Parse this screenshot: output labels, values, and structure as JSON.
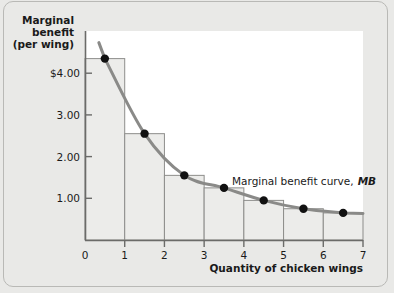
{
  "figure": {
    "background_color": "#e9e9e7",
    "frame_color": "#b9b9b6",
    "plot_background_color": "#ffffff"
  },
  "chart_data": {
    "type": "bar",
    "title": "",
    "subtitle": "",
    "xlabel": "Quantity of chicken wings",
    "ylabel": "Marginal benefit (per wing)",
    "ylabel_lines": [
      "Marginal",
      "benefit",
      "(per wing)"
    ],
    "xlim": [
      0,
      7
    ],
    "ylim": [
      0,
      4.8
    ],
    "grid": false,
    "legend_position": "inside-right",
    "xticks": [
      0,
      1,
      2,
      3,
      4,
      5,
      6,
      7
    ],
    "xtick_labels": [
      "0",
      "1",
      "2",
      "3",
      "4",
      "5",
      "6",
      "7"
    ],
    "yticks": [
      1.0,
      2.0,
      3.0,
      4.0
    ],
    "ytick_labels": [
      "1.00",
      "2.00",
      "3.00",
      "$4.00"
    ],
    "categories": [
      "0-1",
      "1-2",
      "2-3",
      "3-4",
      "4-5",
      "5-6",
      "6-7"
    ],
    "bar_x_left": [
      0,
      1,
      2,
      3,
      4,
      5,
      6
    ],
    "bar_x_right": [
      1,
      2,
      3,
      4,
      5,
      6,
      7
    ],
    "values": [
      4.35,
      2.55,
      1.55,
      1.25,
      0.95,
      0.75,
      0.65
    ],
    "bar_fill_color": "#ececea",
    "bar_edge_color": "#8d8d8b",
    "series": [
      {
        "name": "Marginal benefit curve, MB",
        "type": "line",
        "color": "#8a8a88",
        "x": [
          0.5,
          1.5,
          2.5,
          3.5,
          4.5,
          5.5,
          6.5
        ],
        "values": [
          4.35,
          2.55,
          1.55,
          1.25,
          0.95,
          0.75,
          0.65
        ],
        "marker": "circle",
        "marker_color": "#111111"
      }
    ],
    "annotations": [
      {
        "text": "Marginal benefit curve,",
        "emphasis_text": "MB",
        "x": 3.6,
        "y": 1.52
      }
    ]
  },
  "axis_labels": {
    "x_axis_title": "Quantity of chicken wings",
    "y_axis_title_line1": "Marginal",
    "y_axis_title_line2": "benefit",
    "y_axis_title_line3": "(per wing)"
  },
  "annotation": {
    "curve_label_text": "Marginal benefit curve,",
    "curve_label_emphasis": "MB"
  }
}
